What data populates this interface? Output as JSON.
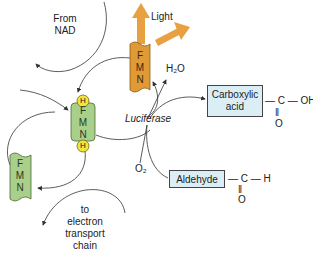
{
  "diagram": {
    "labels": {
      "from_nad": [
        "From",
        "NAD"
      ],
      "light": "Light",
      "h2o": "H₂O",
      "luciferase": "Luciferase",
      "o2": "O₂",
      "electron_chain": [
        "to",
        "electron",
        "transport",
        "chain"
      ]
    },
    "fmn_oxidized_top": {
      "letters": [
        "F",
        "M",
        "N"
      ],
      "color": "#e09a35"
    },
    "fmn_reduced": {
      "letters": [
        "F",
        "M",
        "N"
      ],
      "h_caps": [
        "H",
        "H"
      ],
      "color": "#a9cf8a",
      "cap_color": "#f2e53a"
    },
    "fmn_oxidized_bottom": {
      "letters": [
        "F",
        "M",
        "N"
      ],
      "color": "#a9cf8a"
    },
    "carboxylic_acid": {
      "label_lines": [
        "Carboxylic",
        "acid"
      ],
      "formula": {
        "main": "— C — OH",
        "double_bond": "‖",
        "oxygen": "O"
      }
    },
    "aldehyde": {
      "label": "Aldehyde",
      "formula": {
        "main": "— C — H",
        "double_bond": "‖",
        "oxygen": "O"
      }
    },
    "colors": {
      "light_arrow": "#e8a040",
      "box_fill": "#dceef5",
      "line": "#333333"
    }
  }
}
